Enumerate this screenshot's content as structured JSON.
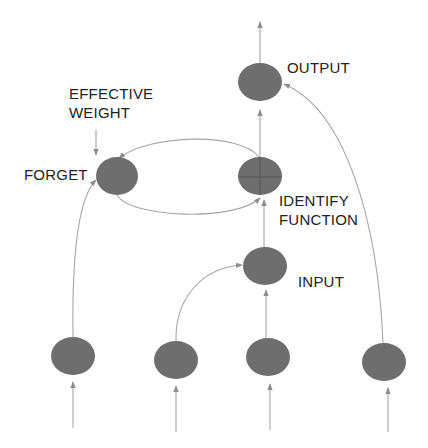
{
  "labels": {
    "output": "OUTPUT",
    "effective_weight_line1": "EFFECTIVE",
    "effective_weight_line2": "WEIGHT",
    "forget": "FORGET",
    "identify_line1": "IDENTIFY",
    "identify_line2": "FUNCTION",
    "input": "INPUT"
  },
  "colors": {
    "node_fill": "#6e6e6e",
    "edge_stroke": "#a6a6a6",
    "text": "#222222",
    "background": "#ffffff"
  },
  "nodes": [
    {
      "id": "output",
      "cx": 260,
      "cy": 82
    },
    {
      "id": "forget",
      "cx": 117,
      "cy": 176
    },
    {
      "id": "identity",
      "cx": 260,
      "cy": 176,
      "cross": true
    },
    {
      "id": "input",
      "cx": 265,
      "cy": 266
    },
    {
      "id": "x1",
      "cx": 73,
      "cy": 356
    },
    {
      "id": "x2",
      "cx": 176,
      "cy": 360
    },
    {
      "id": "x3",
      "cx": 268,
      "cy": 357
    },
    {
      "id": "x4",
      "cx": 384,
      "cy": 362
    }
  ]
}
